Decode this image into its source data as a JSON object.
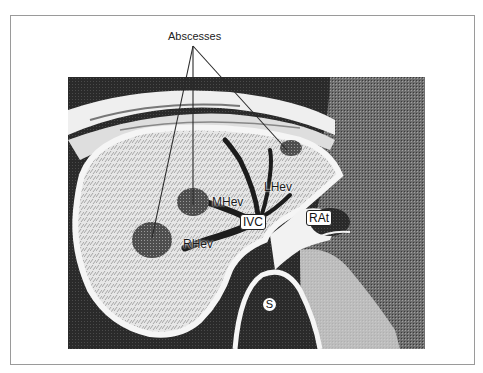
{
  "figure": {
    "title_label": "Abscesses",
    "labels": {
      "mhev": "MHev",
      "lhev": "LHev",
      "rhev": "RHev",
      "ivc": "IVC",
      "rat": "RAt",
      "s": "S"
    },
    "colors": {
      "background": "#ffffff",
      "frame_border": "#9a9a9a",
      "dark_tissue": "#1e1e1e",
      "liver": "#d9d9d9",
      "bright": "#f4f4f4"
    }
  }
}
